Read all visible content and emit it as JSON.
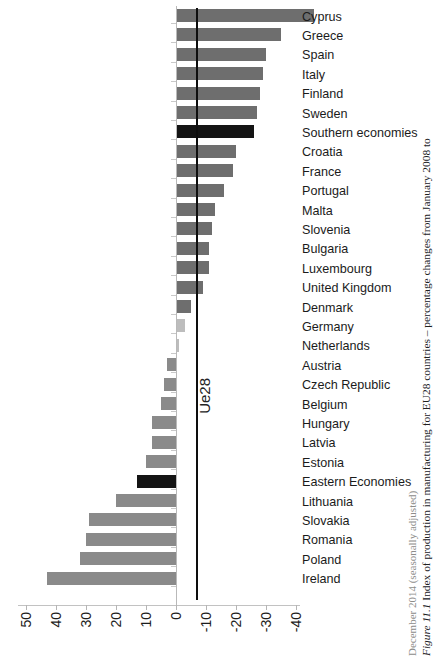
{
  "caption": {
    "figure_number": "Figure 11.1",
    "line1": " Index of production in manufacturing for EU28 countries – percentage changes from January 2008 to",
    "line2": "December 2014 (seasonally adjusted)"
  },
  "reference_line": {
    "label": "Ue28",
    "value": -7
  },
  "axis": {
    "tick_labels": [
      "50",
      "40",
      "30",
      "20",
      "10",
      "0",
      "-10",
      "-20",
      "-30",
      "-40"
    ],
    "tick_values": [
      50,
      40,
      30,
      20,
      10,
      0,
      -10,
      -20,
      -30,
      -40
    ]
  },
  "colors": {
    "bar_default": "#6e6e6e",
    "bar_aggregate": "#141414",
    "bar_light": "#bdbdbd",
    "reference_line": "#0e0e0e",
    "axis": "#b9b9b9"
  },
  "chart_data": {
    "type": "bar",
    "orientation": "horizontal",
    "title": "Index of production in manufacturing for EU28 countries – percentage changes from January 2008 to December 2014 (seasonally adjusted)",
    "xlabel": "Percentage change (%)",
    "ylabel": "",
    "xlim": [
      50,
      -40
    ],
    "x_axis_reversed": true,
    "grid": false,
    "legend": false,
    "reference_line_value": -7,
    "reference_line_label": "Ue28",
    "categories": [
      "Cyprus",
      "Greece",
      "Spain",
      "Italy",
      "Finland",
      "Sweden",
      "Southern economies",
      "Croatia",
      "France",
      "Portugal",
      "Malta",
      "Slovenia",
      "Bulgaria",
      "Luxembourg",
      "United Kingdom",
      "Denmark",
      "Germany",
      "Netherlands",
      "Austria",
      "Czech Republic",
      "Belgium",
      "Hungary",
      "Latvia",
      "Estonia",
      "Eastern Economies",
      "Lithuania",
      "Slovakia",
      "Romania",
      "Poland",
      "Ireland"
    ],
    "values": [
      -46,
      -35,
      -30,
      -29,
      -28,
      -27,
      -26,
      -20,
      -19,
      -16,
      -13,
      -12,
      -11,
      -11,
      -9,
      -5,
      -3,
      -1,
      3,
      4,
      5,
      8,
      8,
      10,
      13,
      20,
      29,
      30,
      32,
      43
    ],
    "bar_styles": [
      "default",
      "default",
      "default",
      "default",
      "default",
      "default",
      "aggregate",
      "default",
      "default",
      "default",
      "default",
      "default",
      "default",
      "default",
      "default",
      "default",
      "light",
      "light",
      "mid",
      "mid",
      "mid",
      "mid",
      "mid",
      "mid",
      "aggregate",
      "mid",
      "mid",
      "mid",
      "mid",
      "mid"
    ]
  }
}
